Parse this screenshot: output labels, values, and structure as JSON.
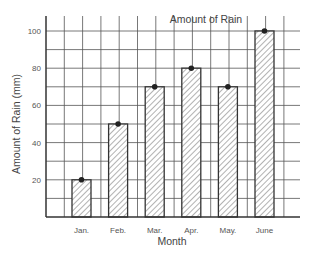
{
  "chart_data": {
    "type": "bar",
    "title": "Amount of Rain",
    "xlabel": "Month",
    "ylabel": "Amount of Rain (mm)",
    "categories": [
      "Jan.",
      "Feb.",
      "Mar.",
      "Apr.",
      "May.",
      "June"
    ],
    "values": [
      20,
      50,
      70,
      80,
      70,
      100
    ],
    "ylim": [
      0,
      110
    ],
    "yticks": [
      20,
      40,
      60,
      80,
      100
    ],
    "grid": true,
    "bar_style": "hatched",
    "markers": "dot on top of each bar",
    "legend": null
  },
  "colors": {
    "grid": "#555555",
    "axis": "#333333",
    "bar_fill": "#ffffff",
    "hatch": "#666666",
    "bar_edge": "#333333",
    "marker": "#222222",
    "text": "#555555"
  }
}
